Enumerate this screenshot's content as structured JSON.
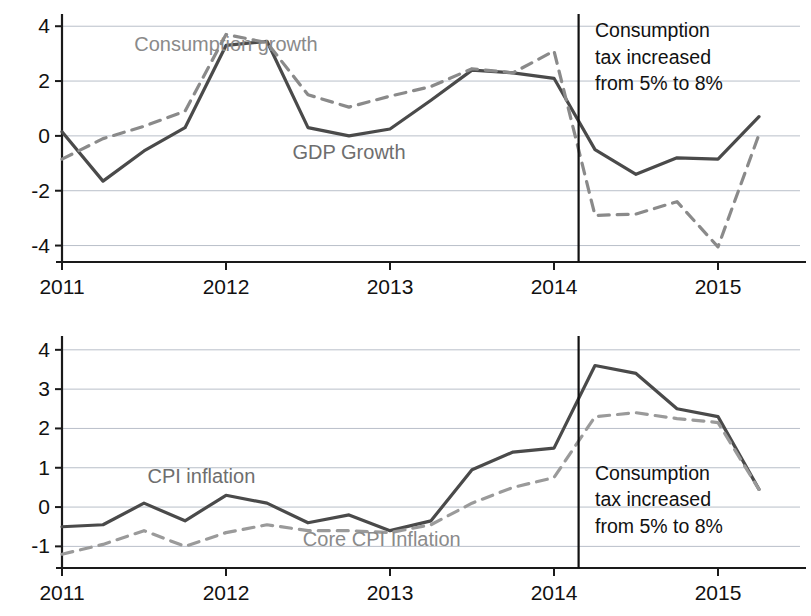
{
  "figure": {
    "title": "",
    "panel_count": 2
  },
  "chart_data": [
    {
      "type": "line",
      "panel": "top",
      "title": "",
      "xlabel": "",
      "ylabel": "",
      "xlim": [
        2011.0,
        2015.5
      ],
      "ylim": [
        -4.6,
        4.3
      ],
      "grid": true,
      "gridlines_y": [
        4,
        2,
        0,
        -2,
        -4
      ],
      "ytick_labels": [
        "4",
        "2",
        "0",
        "-2",
        "-4"
      ],
      "ytick_values": [
        4,
        2,
        0,
        -2,
        -4
      ],
      "xtick_labels": [
        "2011",
        "2012",
        "2013",
        "2014",
        "2015"
      ],
      "xtick_values": [
        2011,
        2012,
        2013,
        2014,
        2015
      ],
      "legend_position": "inline-annotation",
      "x": [
        2011.0,
        2011.25,
        2011.5,
        2011.75,
        2012.0,
        2012.25,
        2012.5,
        2012.75,
        2013.0,
        2013.25,
        2013.5,
        2013.75,
        2014.0,
        2014.25,
        2014.5,
        2014.75,
        2015.0,
        2015.25
      ],
      "series": [
        {
          "name": "GDP Growth",
          "style": "solid",
          "color": "#4a4a4a",
          "label_x": 2012.75,
          "label_y": -0.85,
          "values": [
            0.15,
            -1.65,
            -0.55,
            0.3,
            3.3,
            3.45,
            0.3,
            0.0,
            0.25,
            1.3,
            2.4,
            2.3,
            2.1,
            -0.5,
            -1.4,
            -0.8,
            -0.85,
            0.7
          ]
        },
        {
          "name": "Consumption growth",
          "style": "dashed",
          "color": "#8a8a8a",
          "label_x": 2012.0,
          "label_y": 3.1,
          "values": [
            -0.85,
            -0.1,
            0.35,
            0.9,
            3.7,
            3.4,
            1.5,
            1.05,
            1.45,
            1.8,
            2.45,
            2.3,
            3.1,
            -2.9,
            -2.85,
            -2.4,
            -4.05,
            0.05
          ]
        }
      ],
      "vline": {
        "x": 2014.15,
        "color": "#111111"
      },
      "annotation": {
        "lines": [
          "Consumption",
          "tax increased",
          "from 5% to 8%"
        ],
        "x": 2014.25,
        "y_top": 3.6
      }
    },
    {
      "type": "line",
      "panel": "bottom",
      "title": "",
      "xlabel": "",
      "ylabel": "",
      "xlim": [
        2011.0,
        2015.5
      ],
      "ylim": [
        -1.55,
        4.25
      ],
      "grid": true,
      "gridlines_y": [
        4,
        3,
        2,
        1,
        0,
        -1
      ],
      "ytick_labels": [
        "4",
        "3",
        "2",
        "1",
        "0",
        "-1"
      ],
      "ytick_values": [
        4,
        3,
        2,
        1,
        0,
        -1
      ],
      "xtick_labels": [
        "2011",
        "2012",
        "2013",
        "2014",
        "2015"
      ],
      "xtick_values": [
        2011,
        2012,
        2013,
        2014,
        2015
      ],
      "legend_position": "inline-annotation",
      "x": [
        2011.0,
        2011.25,
        2011.5,
        2011.75,
        2012.0,
        2012.25,
        2012.5,
        2012.75,
        2013.0,
        2013.25,
        2013.5,
        2013.75,
        2014.0,
        2014.25,
        2014.5,
        2014.75,
        2015.0,
        2015.25
      ],
      "series": [
        {
          "name": "CPI inflation",
          "style": "solid",
          "color": "#4a4a4a",
          "label_x": 2011.85,
          "label_y": 0.62,
          "values": [
            -0.5,
            -0.45,
            0.1,
            -0.35,
            0.3,
            0.1,
            -0.4,
            -0.2,
            -0.6,
            -0.35,
            0.95,
            1.4,
            1.5,
            3.6,
            3.4,
            2.5,
            2.3,
            0.45
          ]
        },
        {
          "name": "Core CPI Inflation",
          "style": "dashed",
          "color": "#9a9a9a",
          "label_x": 2012.95,
          "label_y": -1.0,
          "values": [
            -1.2,
            -0.95,
            -0.6,
            -1.0,
            -0.65,
            -0.45,
            -0.6,
            -0.6,
            -0.65,
            -0.45,
            0.1,
            0.5,
            0.75,
            2.3,
            2.4,
            2.25,
            2.15,
            0.45
          ]
        }
      ],
      "vline": {
        "x": 2014.15,
        "color": "#111111"
      },
      "annotation": {
        "lines": [
          "Consumption",
          "tax increased",
          "from 5% to 8%"
        ],
        "x": 2014.25,
        "y_top": 0.7
      }
    }
  ]
}
